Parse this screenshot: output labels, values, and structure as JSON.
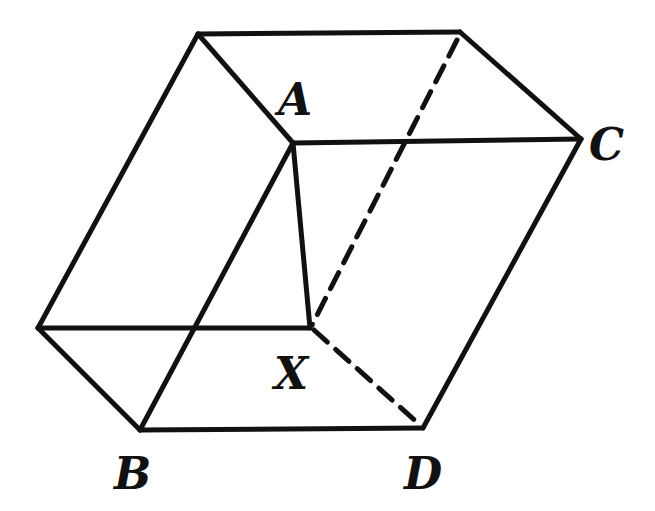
{
  "figure": {
    "stroke_color": "#111111",
    "background": "#ffffff"
  },
  "labels": {
    "A": "A",
    "B": "B",
    "C": "C",
    "D": "D",
    "X": "X"
  },
  "vertices": {
    "top_back_left": [
      198,
      34
    ],
    "top_back_right": [
      460,
      32
    ],
    "A": [
      293,
      143
    ],
    "C": [
      581,
      139
    ],
    "left": [
      38,
      328
    ],
    "X": [
      310,
      328
    ],
    "B": [
      140,
      430
    ],
    "D": [
      423,
      428
    ]
  },
  "edges": {
    "solid": [
      [
        "top_back_left",
        "top_back_right"
      ],
      [
        "top_back_right",
        "C"
      ],
      [
        "top_back_left",
        "A"
      ],
      [
        "A",
        "C"
      ],
      [
        "top_back_left",
        "left"
      ],
      [
        "left",
        "X"
      ],
      [
        "A",
        "X"
      ],
      [
        "A",
        "B"
      ],
      [
        "left",
        "B"
      ],
      [
        "B",
        "D"
      ],
      [
        "C",
        "D"
      ]
    ],
    "dashed": [
      [
        "top_back_right",
        "X"
      ],
      [
        "X",
        "D"
      ]
    ]
  }
}
